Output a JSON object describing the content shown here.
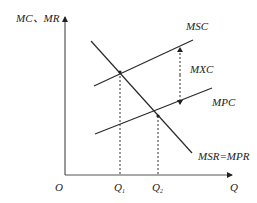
{
  "diagram": {
    "axes": {
      "y_label": "MC、MR",
      "x_label": "Q",
      "origin_label": "O"
    },
    "curves": {
      "msc": {
        "label": "MSC"
      },
      "mpc": {
        "label": "MPC"
      },
      "demand": {
        "label": "MSR=MPR"
      }
    },
    "gap": {
      "label": "MXC"
    },
    "quantities": {
      "q1": {
        "base": "Q",
        "sub": "1"
      },
      "q2": {
        "base": "Q",
        "sub": "2"
      }
    },
    "colors": {
      "line": "#2a2a2a",
      "axis": "#555555",
      "text": "#222222"
    }
  }
}
